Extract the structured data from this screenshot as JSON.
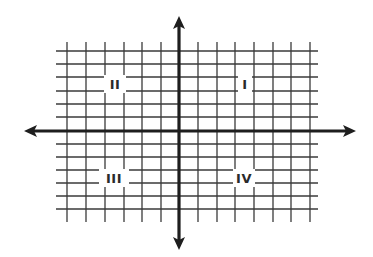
{
  "diagram": {
    "type": "coordinate-plane",
    "colors": {
      "background": "#ffffff",
      "grid": "#3a3a3a",
      "axis": "#1e1e1e",
      "label": "#2a2a2a"
    },
    "grid": {
      "x_min": 56,
      "x_max": 318,
      "y_min": 42,
      "y_max": 222,
      "vertical_lines": [
        67,
        86,
        105,
        124,
        142,
        161,
        198,
        217,
        235,
        254,
        273,
        291,
        310
      ],
      "horizontal_lines": [
        51,
        64,
        77,
        91,
        104,
        117,
        144,
        157,
        170,
        183,
        196,
        209
      ],
      "h_line_x_start": 56,
      "h_line_x_end": 318,
      "v_line_y_start": 42,
      "v_line_y_end": 222
    },
    "axes": {
      "x_axis": {
        "y": 131,
        "x_start": 24,
        "x_end": 356
      },
      "y_axis": {
        "x": 179,
        "y_start": 16,
        "y_end": 250
      }
    },
    "quadrants": [
      {
        "id": "I",
        "label": "I",
        "x": 245,
        "y": 84
      },
      {
        "id": "II",
        "label": "II",
        "x": 115,
        "y": 84
      },
      {
        "id": "III",
        "label": "III",
        "x": 114,
        "y": 178
      },
      {
        "id": "IV",
        "label": "IV",
        "x": 244,
        "y": 178
      }
    ]
  }
}
